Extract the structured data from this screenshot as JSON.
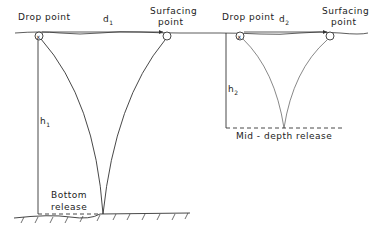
{
  "diagram": {
    "left": {
      "drop_label": "Drop point",
      "distance_label": "d",
      "distance_sub": "1",
      "surfacing_label_1": "Surfacing",
      "surfacing_label_2": "point",
      "height_label": "h",
      "height_sub": "1",
      "release_label_1": "Bottom",
      "release_label_2": "release"
    },
    "right": {
      "drop_label": "Drop point",
      "distance_label": "d",
      "distance_sub": "2",
      "surfacing_label_1": "Surfacing",
      "surfacing_label_2": "point",
      "height_label": "h",
      "height_sub": "2",
      "release_label": "Mid - depth release"
    }
  }
}
